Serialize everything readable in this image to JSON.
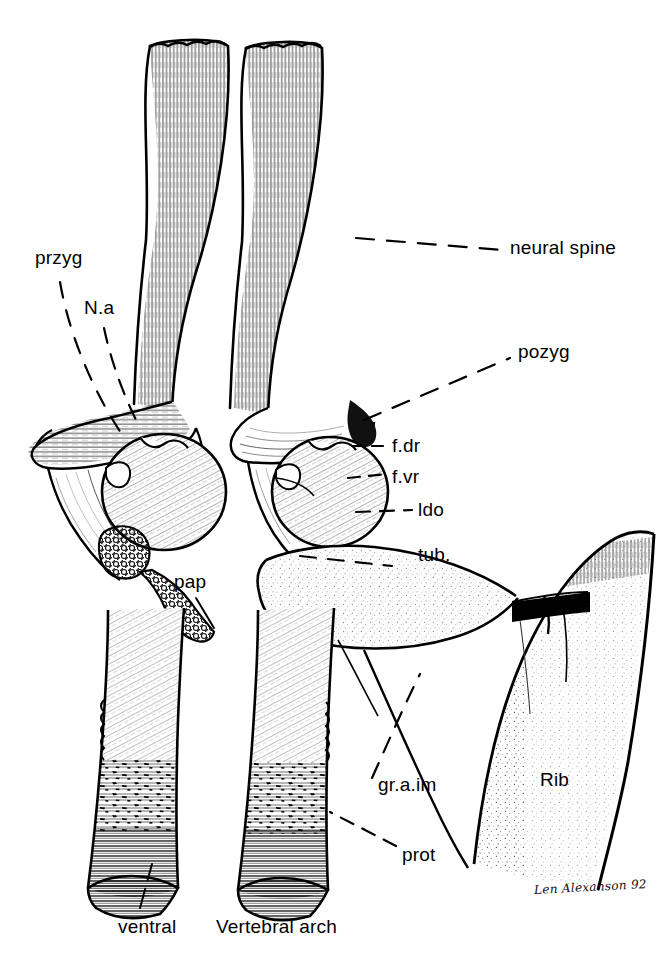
{
  "figure": {
    "kind": "anatomical-line-drawing",
    "background_color": "#ffffff",
    "ink_color": "#000000",
    "signature": "Len Alexanson 92"
  },
  "labels": {
    "przyg": "przyg",
    "na": "N.a",
    "neural_spine": "neural spine",
    "pozyg": "pozyg",
    "fdr": "f.dr",
    "fvr": "f.vr",
    "ldo": "ldo",
    "tub": "tub.",
    "pap": "pap",
    "graim": "gr.a.im",
    "prot": "prot",
    "rib": "Rib",
    "ventral": "ventral",
    "vertebral_arch": "Vertebral arch"
  }
}
